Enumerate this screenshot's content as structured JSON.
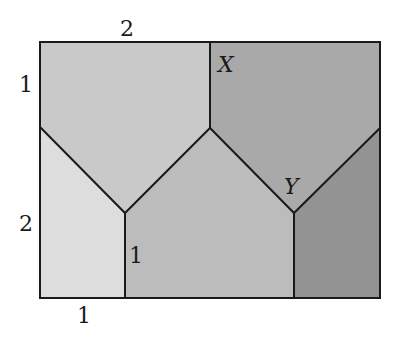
{
  "diagram": {
    "rectangle": {
      "x1": 40,
      "y1": 42,
      "x2": 380,
      "y2": 298
    },
    "regions": [
      {
        "id": "top-left",
        "color": "#c9c9c9",
        "points": "40,42 210,42 210,128 125,213 40,127"
      },
      {
        "id": "top-right",
        "color": "#a9a9a9",
        "points": "210,42 380,42 380,128 294,213 210,128"
      },
      {
        "id": "bottom-left",
        "color": "#dddddd",
        "points": "40,127 125,213 125,298 40,298"
      },
      {
        "id": "bottom-center",
        "color": "#bcbcbc",
        "points": "125,213 210,128 294,213 294,298 125,298"
      },
      {
        "id": "bottom-right",
        "color": "#939393",
        "points": "294,213 380,128 380,298 294,298"
      }
    ],
    "line_color": "#1a1a1a",
    "labels": {
      "top_length": "2",
      "left_upper_length": "1",
      "left_lower_length": "2",
      "bottom_length": "1",
      "inner_vertical_length": "1",
      "point_x": "X",
      "point_y": "Y"
    }
  }
}
